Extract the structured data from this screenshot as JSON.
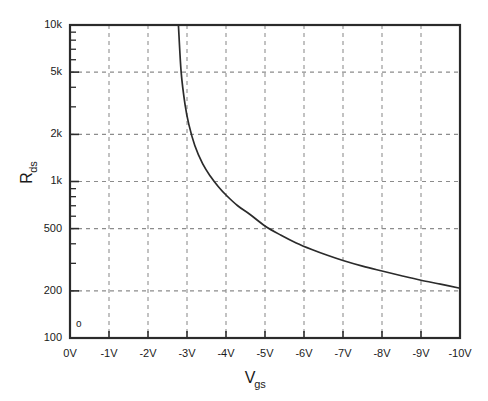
{
  "chart_data": {
    "type": "line",
    "title": "",
    "xlabel": "Vgs",
    "xlabel_base": "V",
    "xlabel_sub": "gs",
    "ylabel": "Rds",
    "ylabel_base": "R",
    "ylabel_sub": "ds",
    "yscale": "log",
    "xscale": "linear",
    "xlim": [
      0,
      -10
    ],
    "ylim": [
      100,
      10000
    ],
    "grid": true,
    "legend": false,
    "xticks": [
      0,
      -1,
      -2,
      -3,
      -4,
      -5,
      -6,
      -7,
      -8,
      -9,
      -10
    ],
    "xtick_labels": [
      "0V",
      "-1V",
      "-2V",
      "-3V",
      "-4V",
      "-5V",
      "-6V",
      "-7V",
      "-8V",
      "-9V",
      "-10V"
    ],
    "yticks": [
      10000,
      5000,
      2000,
      1000,
      500,
      200,
      100
    ],
    "ytick_labels": [
      "10k",
      "5k",
      "2k",
      "1k",
      "500",
      "200",
      "100"
    ],
    "yticks_minor": [
      9000,
      8000,
      7000,
      6000,
      4000,
      3000,
      900,
      800,
      700,
      600,
      400,
      300
    ],
    "corner_mark": "o",
    "series": [
      {
        "name": "Rds vs Vgs",
        "color": "#2b2b2b",
        "x": [
          -2.78,
          -2.85,
          -2.95,
          -3.05,
          -3.2,
          -3.4,
          -3.6,
          -3.8,
          -4.0,
          -4.3,
          -4.6,
          -5.0,
          -5.4,
          -5.8,
          -6.2,
          -6.6,
          -7.0,
          -7.5,
          -8.0,
          -8.5,
          -9.0,
          -9.5,
          -10.0
        ],
        "y": [
          10000,
          5000,
          3100,
          2300,
          1700,
          1300,
          1080,
          930,
          820,
          700,
          620,
          520,
          455,
          405,
          368,
          338,
          313,
          288,
          268,
          250,
          234,
          221,
          208
        ]
      }
    ],
    "colors": {
      "curve": "#2b2b2b",
      "axis": "#2b2b2b",
      "grid": "#8c8c8c",
      "background": "#ffffff",
      "text": "#1a1a1a"
    }
  }
}
